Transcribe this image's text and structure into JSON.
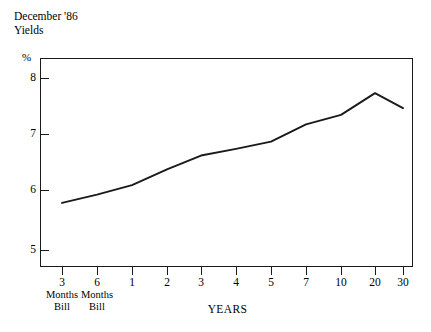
{
  "title": {
    "line1": "December '86",
    "line2": "Yields"
  },
  "axes": {
    "y_unit": "%",
    "x_title": "YEARS",
    "y_ticks": [
      "8",
      "7",
      "6",
      "5"
    ],
    "x_tick_labels": [
      "3",
      "6",
      "1",
      "2",
      "3",
      "4",
      "5",
      "7",
      "10",
      "20",
      "30"
    ],
    "x_sub_labels": [
      {
        "l1": "Months",
        "l2": "Bill"
      },
      {
        "l1": "Months",
        "l2": "Bill"
      }
    ]
  },
  "colors": {
    "line": "#1a1a1a",
    "frame": "#1a1a1a",
    "background": "#ffffff"
  },
  "chart_data": {
    "type": "line",
    "title": "December '86 Yields",
    "xlabel": "YEARS",
    "ylabel": "%",
    "ylim": [
      4.6,
      8.35
    ],
    "grid": false,
    "legend": null,
    "categories": [
      "3 Months Bill",
      "6 Months Bill",
      "1",
      "2",
      "3",
      "4",
      "5",
      "7",
      "10",
      "20",
      "30"
    ],
    "tick_labels": [
      "3",
      "6",
      "1",
      "2",
      "3",
      "4",
      "5",
      "7",
      "10",
      "20",
      "30"
    ],
    "values": [
      5.75,
      5.9,
      6.07,
      6.35,
      6.6,
      6.72,
      6.85,
      7.16,
      7.33,
      7.72,
      7.45
    ],
    "y_ticks": [
      8,
      7,
      6,
      5
    ]
  }
}
